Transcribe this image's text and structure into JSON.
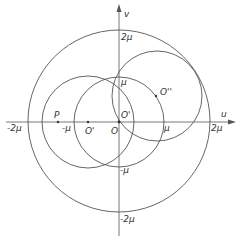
{
  "figure": {
    "type": "geometric diagram",
    "colors": {
      "stroke": "#555555",
      "text": "#333333",
      "background": "#ffffff"
    }
  },
  "axes": {
    "x_label": "u",
    "y_label": "v",
    "x_ticks": [
      "-2μ",
      "-μ",
      "μ",
      "2μ"
    ],
    "y_ticks": [
      "2μ",
      "μ",
      "-μ",
      "-2μ"
    ],
    "origin_label": "O"
  },
  "points": {
    "P": "P",
    "O_prime_left": "O'",
    "O_prime_origin": "O'",
    "O_double_prime": "O''"
  },
  "circles": [
    {
      "name": "outer",
      "center": "O",
      "radius": "2μ"
    },
    {
      "name": "left",
      "center": "O'",
      "radius": "μ"
    },
    {
      "name": "middle",
      "center": "O",
      "radius": "μ"
    },
    {
      "name": "upper-right",
      "center": "O''",
      "radius": "μ"
    }
  ]
}
